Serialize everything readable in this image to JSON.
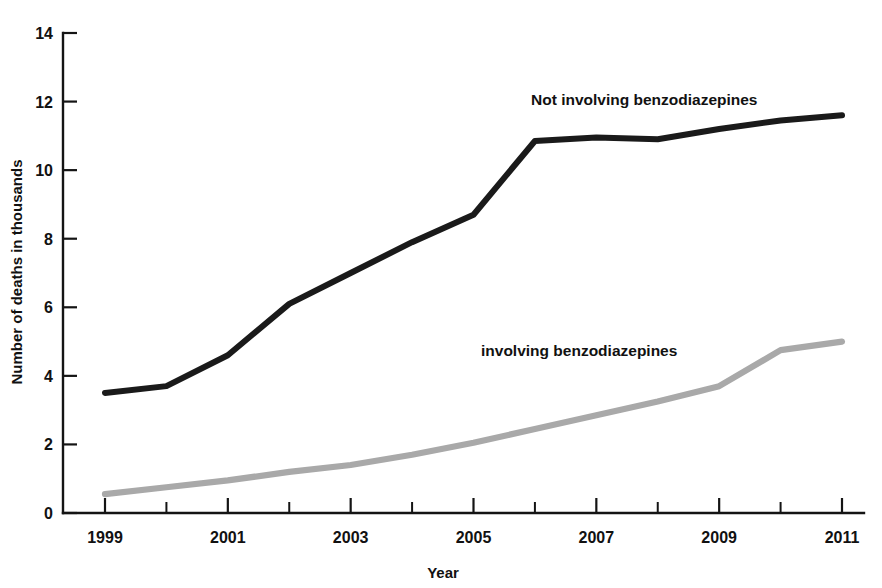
{
  "chart_data": {
    "type": "line",
    "title": "",
    "subtitle": "",
    "xlabel": "Year",
    "ylabel": "Number of deaths in thousands",
    "xlim": [
      1999,
      2011
    ],
    "ylim": [
      0,
      14
    ],
    "grid": false,
    "legend_position": "inline-labels",
    "x": [
      1999,
      2000,
      2001,
      2002,
      2003,
      2004,
      2005,
      2006,
      2007,
      2008,
      2009,
      2010,
      2011
    ],
    "x_tick_labels": [
      "1999",
      "",
      "2001",
      "",
      "2003",
      "",
      "2005",
      "",
      "2007",
      "",
      "2009",
      "",
      "2011"
    ],
    "x_ticks_all": [
      1999,
      2000,
      2001,
      2002,
      2003,
      2004,
      2005,
      2006,
      2007,
      2008,
      2009,
      2010,
      2011
    ],
    "y_ticks": [
      0,
      2,
      4,
      6,
      8,
      10,
      12,
      14
    ],
    "y_tick_labels": [
      "0",
      "2",
      "4",
      "6",
      "8",
      "10",
      "12",
      "14"
    ],
    "series": [
      {
        "name": "Not involving benzodiazepines",
        "color": "#1a1a1a",
        "label_text": "Not involving benzodiazepines",
        "values": [
          3.5,
          3.7,
          4.6,
          6.1,
          7.0,
          7.9,
          8.7,
          10.85,
          10.95,
          10.9,
          11.2,
          11.45,
          11.6
        ]
      },
      {
        "name": "involving benzodiazepines",
        "color": "#a9a9a9",
        "label_text": "involving benzodiazepines",
        "values": [
          0.55,
          0.75,
          0.95,
          1.2,
          1.4,
          1.7,
          2.05,
          2.45,
          2.85,
          3.25,
          3.7,
          4.75,
          5.0
        ]
      }
    ]
  },
  "labels": {
    "y_axis_title": "Number of deaths in thousands",
    "x_axis_title": "Year",
    "series_top": "Not involving benzodiazepines",
    "series_bottom": "involving benzodiazepines"
  }
}
